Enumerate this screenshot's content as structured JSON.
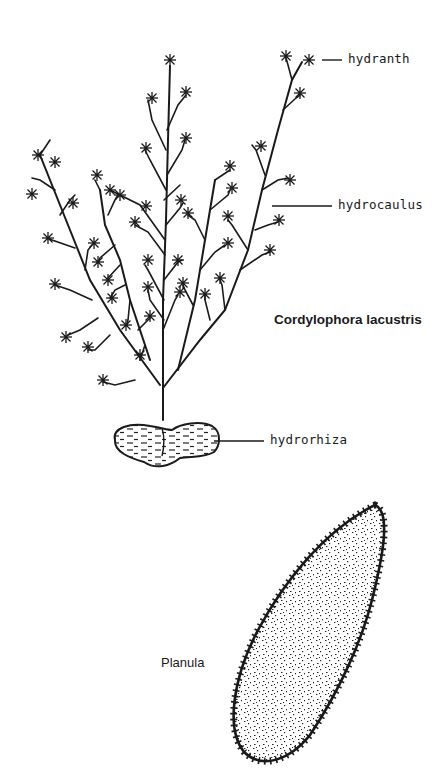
{
  "figure": {
    "title": "Cordylophora lacustris",
    "labels": {
      "hydranth": "hydranth",
      "hydrocaulus": "hydrocaulus",
      "hydrorhiza": "hydrorhiza",
      "planula": "Planula"
    }
  },
  "colors": {
    "ink": "#1a1a1a",
    "background": "#ffffff"
  }
}
